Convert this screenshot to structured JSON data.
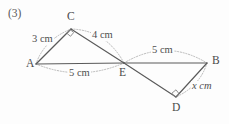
{
  "problem": {
    "number_label": "(3)"
  },
  "figure": {
    "caption_vertices": [
      "A",
      "C",
      "E",
      "B",
      "D"
    ],
    "vertices": [
      {
        "id": "A",
        "label": "A",
        "x": 36,
        "y": 64,
        "label_x": 26,
        "label_y": 59
      },
      {
        "id": "C",
        "label": "C",
        "x": 71,
        "y": 29,
        "label_x": 67,
        "label_y": 12
      },
      {
        "id": "E",
        "label": "E",
        "x": 124,
        "y": 63,
        "label_x": 120,
        "label_y": 68
      },
      {
        "id": "B",
        "label": "B",
        "x": 207,
        "y": 63,
        "label_x": 212,
        "label_y": 56
      },
      {
        "id": "D",
        "label": "D",
        "x": 176,
        "y": 97,
        "label_x": 172,
        "label_y": 103
      }
    ],
    "edges": [
      {
        "from": "A",
        "to": "C"
      },
      {
        "from": "C",
        "to": "E"
      },
      {
        "from": "A",
        "to": "E"
      },
      {
        "from": "E",
        "to": "B"
      },
      {
        "from": "E",
        "to": "D"
      },
      {
        "from": "D",
        "to": "B"
      }
    ],
    "right_angles": [
      {
        "at": "C",
        "between": [
          "A",
          "E"
        ]
      },
      {
        "at": "D",
        "between": [
          "E",
          "B"
        ]
      }
    ],
    "measurements": [
      {
        "id": "AC",
        "value": "3",
        "unit": "cm",
        "text": "3 cm",
        "is_variable": false,
        "label_x": 32,
        "label_y": 35
      },
      {
        "id": "CE",
        "value": "4",
        "unit": "cm",
        "text": "4 cm",
        "is_variable": false,
        "label_x": 92,
        "label_y": 31
      },
      {
        "id": "AE",
        "value": "5",
        "unit": "cm",
        "text": "5 cm",
        "is_variable": false,
        "label_x": 69,
        "label_y": 69
      },
      {
        "id": "EB",
        "value": "5",
        "unit": "cm",
        "text": "5 cm",
        "is_variable": false,
        "label_x": 152,
        "label_y": 46
      },
      {
        "id": "BD",
        "value": "x",
        "unit": "cm",
        "text": "x cm",
        "is_variable": true,
        "label_x": 192,
        "label_y": 82
      }
    ],
    "colors": {
      "line": "#5a5a5a",
      "guide": "#9a9a9a",
      "text": "#4a4a4a",
      "background": "#fdfdfd"
    }
  }
}
